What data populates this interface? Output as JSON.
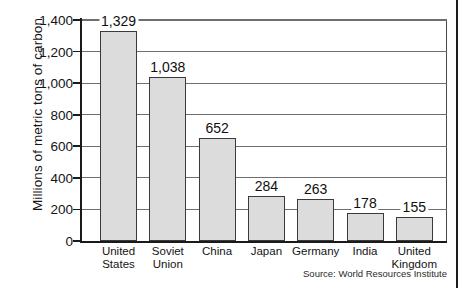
{
  "chart_data": {
    "type": "bar",
    "title": "",
    "xlabel": "",
    "ylabel": "Millions of metric tons of carbon",
    "ylim": [
      0,
      1400
    ],
    "ytick_values": [
      0,
      200,
      400,
      600,
      800,
      1000,
      1200,
      1400
    ],
    "ytick_labels": [
      "0",
      "200",
      "400",
      "600",
      "800",
      "1,000",
      "1,200",
      "1,400"
    ],
    "grid": true,
    "legend": "none",
    "categories": [
      "United States",
      "Soviet Union",
      "China",
      "Japan",
      "Germany",
      "India",
      "United Kingdom"
    ],
    "category_lines": [
      [
        "United",
        "States"
      ],
      [
        "Soviet",
        "Union"
      ],
      [
        "China",
        ""
      ],
      [
        "Japan",
        ""
      ],
      [
        "Germany",
        ""
      ],
      [
        "India",
        ""
      ],
      [
        "United",
        "Kingdom"
      ]
    ],
    "values": [
      1329,
      1038,
      652,
      284,
      263,
      178,
      155
    ],
    "value_labels": [
      "1,329",
      "1,038",
      "652",
      "284",
      "263",
      "178",
      "155"
    ],
    "bar_fill_color": "#dcdcdc",
    "bar_edge_color": "#3a3a3a",
    "gridline_color": "#6e6e6e",
    "axis_color": "#1a1a1a",
    "source": "Source: World Resources Institute"
  }
}
